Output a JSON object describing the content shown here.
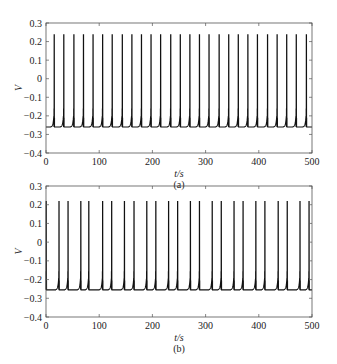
{
  "chart_data": [
    {
      "type": "line",
      "panel_label": "(a)",
      "xlabel": "t/s",
      "ylabel": "V",
      "xlim": [
        0,
        500
      ],
      "ylim": [
        -0.4,
        0.3
      ],
      "xticks": [
        "0",
        "100",
        "200",
        "300",
        "400",
        "500"
      ],
      "yticks": [
        "0.3",
        "0.2",
        "0.1",
        "0",
        "−0.1",
        "−0.2",
        "−0.3",
        "−0.4"
      ],
      "grid": false,
      "description": "Periodic spiking, regular interspike interval ~18 s",
      "baseline": -0.26,
      "peak": 0.24,
      "spike_times": [
        15,
        33,
        52,
        70,
        88,
        106,
        124,
        143,
        161,
        179,
        197,
        215,
        234,
        252,
        270,
        288,
        306,
        325,
        343,
        361,
        379,
        397,
        416,
        434,
        452,
        470,
        489
      ]
    },
    {
      "type": "line",
      "panel_label": "(b)",
      "xlabel": "t/s",
      "ylabel": "V",
      "xlim": [
        0,
        500
      ],
      "ylim": [
        -0.4,
        0.3
      ],
      "xticks": [
        "0",
        "100",
        "200",
        "300",
        "400",
        "500"
      ],
      "yticks": [
        "0.3",
        "0.2",
        "0.1",
        "0",
        "−0.1",
        "−0.2",
        "−0.3",
        "−0.4"
      ],
      "grid": false,
      "description": "Period-2 spiking with alternating interspike intervals (~24 s and ~17 s)",
      "baseline": -0.255,
      "peak": 0.22,
      "spike_times": [
        0,
        24,
        41,
        65,
        80,
        106,
        123,
        147,
        165,
        189,
        206,
        230,
        247,
        271,
        288,
        312,
        329,
        353,
        370,
        394,
        411,
        436,
        453,
        477,
        494
      ]
    }
  ],
  "captions": {
    "a": "(a)",
    "b": "(b)"
  },
  "axis": {
    "xlabel": "t/s",
    "ylabel": "V"
  }
}
